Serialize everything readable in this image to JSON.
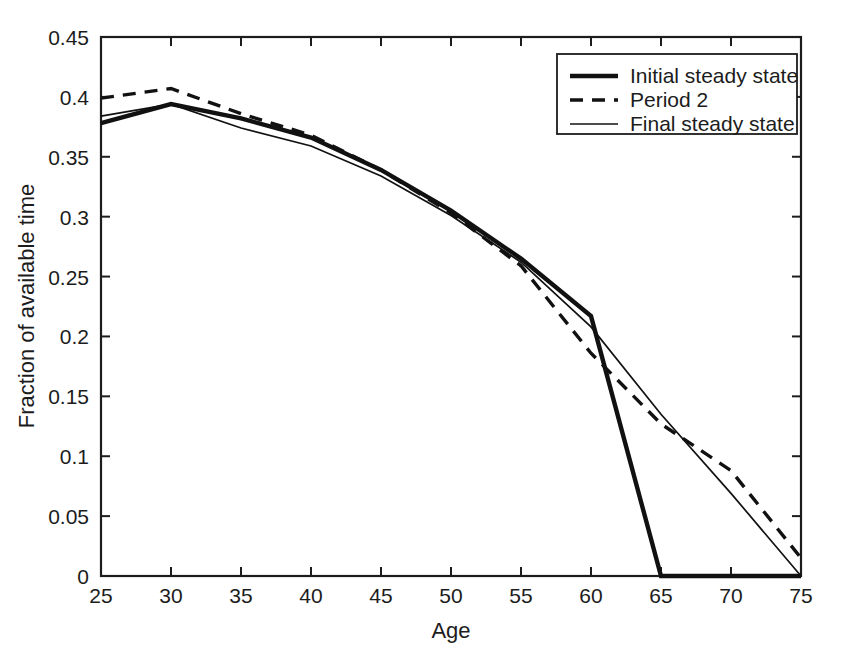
{
  "chart_data": {
    "type": "line",
    "title": "",
    "xlabel": "Age",
    "ylabel": "Fraction of available time",
    "xlim": [
      25,
      75
    ],
    "ylim": [
      0,
      0.45
    ],
    "xticks": [
      25,
      30,
      35,
      40,
      45,
      50,
      55,
      60,
      65,
      70,
      75
    ],
    "xtick_labels": [
      "25",
      "30",
      "35",
      "40",
      "45",
      "50",
      "55",
      "60",
      "65",
      "70",
      "75"
    ],
    "yticks": [
      0,
      0.05,
      0.1,
      0.15,
      0.2,
      0.25,
      0.3,
      0.35,
      0.4,
      0.45
    ],
    "ytick_labels": [
      "0",
      "0.05",
      "0.1",
      "0.15",
      "0.2",
      "0.25",
      "0.3",
      "0.35",
      "0.4",
      "0.45"
    ],
    "grid": false,
    "legend_position": "top-right",
    "series": [
      {
        "name": "Initial steady state",
        "style": "thick-solid",
        "color": "#111111",
        "x": [
          25,
          30,
          35,
          40,
          45,
          50,
          55,
          60,
          65,
          70,
          75
        ],
        "values": [
          0.378,
          0.394,
          0.382,
          0.366,
          0.339,
          0.305,
          0.265,
          0.217,
          0.0,
          0.0,
          0.0
        ]
      },
      {
        "name": "Period 2",
        "style": "dashed",
        "color": "#111111",
        "x": [
          25,
          30,
          35,
          40,
          45,
          50,
          55,
          60,
          65,
          70,
          75
        ],
        "values": [
          0.399,
          0.407,
          0.386,
          0.368,
          0.339,
          0.303,
          0.259,
          0.186,
          0.127,
          0.088,
          0.015
        ]
      },
      {
        "name": "Final steady state",
        "style": "thin-solid",
        "color": "#111111",
        "x": [
          25,
          30,
          35,
          40,
          45,
          50,
          55,
          60,
          65,
          70,
          75
        ],
        "values": [
          0.384,
          0.394,
          0.374,
          0.359,
          0.334,
          0.301,
          0.262,
          0.208,
          0.135,
          0.069,
          0.0
        ]
      }
    ]
  },
  "legend": {
    "items": [
      {
        "label": "Initial steady state",
        "style": "thick-solid"
      },
      {
        "label": "Period 2",
        "style": "dashed"
      },
      {
        "label": "Final steady state",
        "style": "thin-solid"
      }
    ]
  },
  "axes": {
    "x_title": "Age",
    "y_title": "Fraction of available time"
  }
}
